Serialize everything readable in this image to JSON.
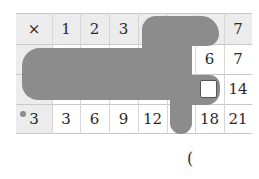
{
  "table": {
    "header_row": [
      "×",
      "1",
      "2",
      "3",
      "",
      "",
      "",
      "7"
    ],
    "rows": [
      {
        "label": "",
        "values": [
          "",
          "",
          "",
          "",
          "",
          "6",
          "7"
        ]
      },
      {
        "label": "",
        "values": [
          "",
          "",
          "",
          "",
          "",
          "",
          "14"
        ]
      },
      {
        "label": "3",
        "values": [
          "3",
          "6",
          "9",
          "12",
          "",
          "18",
          "21"
        ]
      }
    ],
    "hidden_by_blob": true,
    "answer_box": ""
  },
  "footer": {
    "paren": "("
  },
  "colors": {
    "header_bg": "#ececec",
    "blob": "#8c8c8c",
    "grid": "#c8c8c8"
  }
}
